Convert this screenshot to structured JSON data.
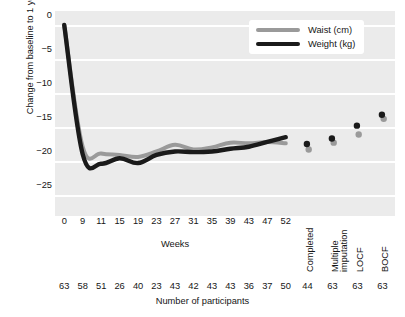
{
  "chart_data": {
    "type": "line",
    "title": "",
    "xlabel": "Weeks",
    "ylabel": "Change from baseline to 1 year",
    "ylim": [
      -27.5,
      1.5
    ],
    "yticks": [
      0,
      -5,
      -10,
      -15,
      -20,
      -25
    ],
    "ytick_labels": [
      "0",
      "−5",
      "−10",
      "−15",
      "−20",
      "−25"
    ],
    "grid": true,
    "legend_position": "top-right",
    "categories": [
      "0",
      "9",
      "11",
      "15",
      "19",
      "23",
      "27",
      "31",
      "35",
      "39",
      "43",
      "47",
      "52"
    ],
    "series": [
      {
        "name": "Waist (cm)",
        "color": "#9a9a9a",
        "values": [
          0.0,
          -17.9,
          -18.9,
          -19.1,
          -19.4,
          -18.6,
          -17.6,
          -18.3,
          -18.0,
          -17.3,
          -17.4,
          -17.2,
          -17.4
        ]
      },
      {
        "name": "Weight (kg)",
        "color": "#1a1a1a",
        "values": [
          0.0,
          -19.0,
          -20.4,
          -19.6,
          -20.3,
          -19.1,
          -18.6,
          -18.7,
          -18.6,
          -18.2,
          -17.9,
          -17.2,
          -16.5
        ]
      }
    ],
    "endpoint_categories": [
      "Completed",
      "Multiple imputation",
      "LOCF",
      "BOCF"
    ],
    "endpoint_points": [
      {
        "name": "Waist (cm)",
        "color": "#9a9a9a",
        "values": [
          -18.3,
          -17.3,
          -16.1,
          -13.8
        ]
      },
      {
        "name": "Weight (kg)",
        "color": "#1a1a1a",
        "values": [
          -17.5,
          -16.7,
          -14.8,
          -13.2
        ]
      }
    ],
    "participants_row_label": "Number of participants",
    "participants": [
      63,
      58,
      51,
      26,
      40,
      23,
      43,
      42,
      43,
      43,
      36,
      37,
      50,
      44,
      63,
      63,
      63
    ]
  },
  "axes": {
    "y_title": "Change from baseline to 1 year",
    "x_title": "Weeks",
    "y_tick_labels": [
      "0",
      "−5",
      "−10",
      "−15",
      "−20",
      "−25"
    ],
    "x_tick_labels": [
      "0",
      "9",
      "11",
      "15",
      "19",
      "23",
      "27",
      "31",
      "35",
      "39",
      "43",
      "47",
      "52"
    ],
    "x_rotated_labels": [
      "Completed",
      "Multiple",
      "imputation",
      "LOCF",
      "BOCF"
    ]
  },
  "legend": {
    "items": [
      {
        "label": "Waist (cm)",
        "color": "#9a9a9a"
      },
      {
        "label": "Weight (kg)",
        "color": "#1a1a1a"
      }
    ]
  },
  "participants_row": {
    "title": "Number of participants",
    "values": [
      "63",
      "58",
      "51",
      "26",
      "40",
      "23",
      "43",
      "42",
      "43",
      "43",
      "36",
      "37",
      "50",
      "44",
      "63",
      "63",
      "63"
    ]
  },
  "colors": {
    "plot_background": "#ebebeb",
    "gridline": "#ffffff",
    "waist": "#9a9a9a",
    "weight": "#1a1a1a",
    "text": "#161616"
  }
}
